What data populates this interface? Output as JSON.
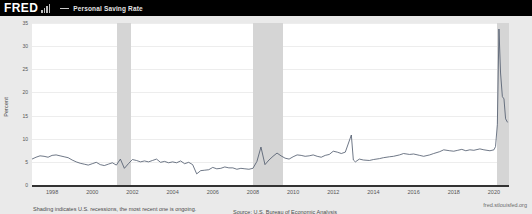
{
  "header": {
    "logo_text": "FRED",
    "logo_icon": "bar-chart-icon",
    "legend_dash": "line-sample-icon",
    "series_label": "Personal Saving Rate"
  },
  "footer": {
    "shading_note": "Shading indicates U.S. recessions, the most recent one is ongoing.",
    "source": "Source: U.S. Bureau of Economic Analysis",
    "attribution": "fred.stlouisfed.org"
  },
  "colors": {
    "page_background": "#eaeaea",
    "header_background": "#000000",
    "plot_background": "#ffffff",
    "line": "#4a5568",
    "recession_shading": "#d5d5d5",
    "gridline": "#ededed",
    "axis": "#333333"
  },
  "chart_data": {
    "type": "line",
    "title": "Personal Saving Rate",
    "xlabel": "",
    "ylabel": "Percent",
    "xlim": [
      1997.0,
      2020.75
    ],
    "ylim": [
      0,
      35
    ],
    "yticks": [
      0,
      5,
      10,
      15,
      20,
      25,
      30,
      35
    ],
    "xticks": [
      1998,
      2000,
      2002,
      2004,
      2006,
      2008,
      2010,
      2012,
      2014,
      2016,
      2018,
      2020
    ],
    "grid": true,
    "legend_position": "top-left-header",
    "units": "Percent",
    "frequency": "Monthly",
    "recessions": [
      {
        "start": 2001.25,
        "end": 2001.92
      },
      {
        "start": 2008.0,
        "end": 2009.5
      },
      {
        "start": 2020.17,
        "end": 2020.75
      }
    ],
    "series": [
      {
        "name": "Personal Saving Rate",
        "x": [
          1997.0,
          1997.2,
          1997.4,
          1997.6,
          1997.8,
          1998.0,
          1998.2,
          1998.4,
          1998.6,
          1998.8,
          1999.0,
          1999.2,
          1999.4,
          1999.6,
          1999.8,
          2000.0,
          2000.2,
          2000.4,
          2000.6,
          2000.8,
          2001.0,
          2001.2,
          2001.4,
          2001.6,
          2001.8,
          2002.0,
          2002.2,
          2002.4,
          2002.6,
          2002.8,
          2003.0,
          2003.2,
          2003.4,
          2003.6,
          2003.8,
          2004.0,
          2004.2,
          2004.4,
          2004.6,
          2004.8,
          2005.0,
          2005.2,
          2005.4,
          2005.6,
          2005.8,
          2006.0,
          2006.2,
          2006.4,
          2006.6,
          2006.8,
          2007.0,
          2007.2,
          2007.4,
          2007.6,
          2007.8,
          2008.0,
          2008.2,
          2008.4,
          2008.6,
          2008.8,
          2009.0,
          2009.2,
          2009.4,
          2009.6,
          2009.8,
          2010.0,
          2010.2,
          2010.4,
          2010.6,
          2010.8,
          2011.0,
          2011.2,
          2011.4,
          2011.6,
          2011.8,
          2012.0,
          2012.2,
          2012.4,
          2012.6,
          2012.9,
          2013.0,
          2013.1,
          2013.3,
          2013.5,
          2013.8,
          2014.0,
          2014.3,
          2014.5,
          2014.8,
          2015.0,
          2015.3,
          2015.5,
          2015.8,
          2016.0,
          2016.3,
          2016.5,
          2016.8,
          2017.0,
          2017.3,
          2017.5,
          2017.8,
          2018.0,
          2018.2,
          2018.4,
          2018.6,
          2018.8,
          2019.0,
          2019.3,
          2019.5,
          2019.8,
          2020.0,
          2020.08,
          2020.17,
          2020.25,
          2020.33,
          2020.42,
          2020.5,
          2020.58,
          2020.67
        ],
        "y": [
          5.6,
          6.0,
          6.3,
          6.2,
          6.0,
          6.4,
          6.5,
          6.3,
          6.1,
          5.9,
          5.4,
          5.0,
          4.7,
          4.5,
          4.3,
          4.6,
          4.9,
          4.4,
          4.2,
          4.5,
          4.8,
          4.3,
          5.6,
          3.6,
          4.6,
          5.5,
          5.3,
          5.0,
          5.2,
          5.0,
          5.3,
          5.6,
          4.9,
          5.1,
          4.8,
          5.0,
          4.8,
          5.2,
          4.6,
          4.9,
          4.4,
          2.4,
          3.1,
          3.2,
          3.3,
          3.8,
          3.5,
          3.6,
          3.9,
          3.7,
          3.7,
          3.4,
          3.6,
          3.5,
          3.4,
          3.6,
          5.1,
          8.2,
          4.4,
          5.4,
          6.2,
          6.9,
          6.3,
          5.8,
          5.6,
          6.1,
          6.5,
          6.4,
          6.2,
          6.3,
          6.5,
          6.2,
          6.0,
          6.4,
          6.6,
          7.3,
          7.1,
          6.8,
          7.1,
          10.8,
          5.4,
          5.0,
          5.6,
          5.4,
          5.3,
          5.5,
          5.7,
          5.9,
          6.1,
          6.2,
          6.5,
          6.8,
          6.6,
          6.7,
          6.4,
          6.2,
          6.5,
          6.8,
          7.2,
          7.6,
          7.4,
          7.3,
          7.5,
          7.7,
          7.4,
          7.6,
          7.5,
          7.8,
          7.6,
          7.4,
          7.6,
          8.3,
          13.1,
          33.7,
          24.2,
          19.1,
          18.6,
          14.3,
          13.6
        ]
      }
    ]
  }
}
